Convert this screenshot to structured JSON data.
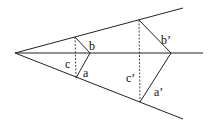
{
  "diagram": {
    "apex": [
      15,
      53
    ],
    "upper_ray_end": [
      183,
      8
    ],
    "lower_ray_end": [
      183,
      119
    ],
    "axis_end": [
      203,
      53
    ],
    "small_triangle": {
      "top": [
        75,
        37
      ],
      "tip": [
        90,
        53
      ],
      "bottom": [
        76,
        78
      ],
      "labels": {
        "b": "b",
        "a": "a",
        "c": "c"
      }
    },
    "large_triangle": {
      "top": [
        139,
        20
      ],
      "tip": [
        171,
        53
      ],
      "bottom": [
        140,
        102
      ],
      "labels": {
        "b": "b’",
        "a": "a’",
        "c": "c’"
      }
    }
  }
}
